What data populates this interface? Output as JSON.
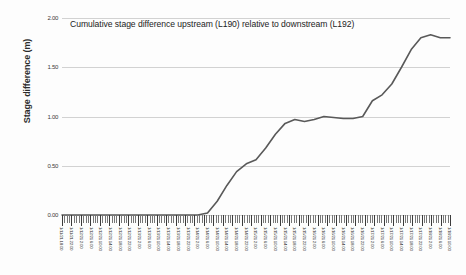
{
  "chart_data": {
    "type": "line",
    "title": "Cumulative stage difference upstream (L190) relative to downstream (L192)",
    "xlabel": "",
    "ylabel": "Stage difference (m)",
    "ylim": [
      0.0,
      2.0
    ],
    "ytick_labels": [
      "0.00",
      "0.50",
      "1.00",
      "1.50",
      "2.00"
    ],
    "ytick_values": [
      0.0,
      0.5,
      1.0,
      1.5,
      2.0
    ],
    "grid": true,
    "legend": "none",
    "line_color": "#595959",
    "series": [
      {
        "name": "Cumulative stage difference",
        "x": [
          "1/11/21 18:00",
          "1/11/21 22:00",
          "1/12/21 2:00",
          "1/12/21 6:00",
          "1/12/21 10:00",
          "1/12/21 14:00",
          "1/12/21 18:00",
          "1/12/21 22:00",
          "1/13/21 2:00",
          "1/13/21 6:00",
          "1/13/21 10:00",
          "1/13/21 14:00",
          "1/13/21 18:00",
          "1/13/21 22:00",
          "1/14/21 2:00",
          "1/14/21 6:00",
          "1/14/21 10:00",
          "1/14/21 14:00",
          "1/14/21 18:00",
          "1/14/21 22:00",
          "1/15/21 2:00",
          "1/15/21 6:00",
          "1/15/21 10:00",
          "1/15/21 14:00",
          "1/15/21 18:00",
          "1/15/21 22:00",
          "1/16/21 2:00",
          "1/16/21 6:00",
          "1/16/21 10:00",
          "1/16/21 14:00",
          "1/16/21 18:00",
          "1/16/21 22:00",
          "1/17/21 2:00",
          "1/17/21 6:00",
          "1/17/21 10:00",
          "1/17/21 14:00",
          "1/17/21 18:00",
          "1/17/21 22:00",
          "1/18/21 2:00",
          "1/18/21 6:00",
          "1/18/21 10:00"
        ],
        "values": [
          0.0,
          0.0,
          0.0,
          0.0,
          0.0,
          0.0,
          0.0,
          0.0,
          0.0,
          0.0,
          0.0,
          0.0,
          0.0,
          0.0,
          0.0,
          0.02,
          0.14,
          0.3,
          0.44,
          0.52,
          0.56,
          0.68,
          0.82,
          0.93,
          0.97,
          0.95,
          0.97,
          1.0,
          0.99,
          0.98,
          0.98,
          1.0,
          1.16,
          1.22,
          1.33,
          1.5,
          1.68,
          1.8,
          1.83,
          1.8,
          1.8
        ]
      }
    ],
    "xtick_count": 41,
    "xminor_count": 164
  }
}
